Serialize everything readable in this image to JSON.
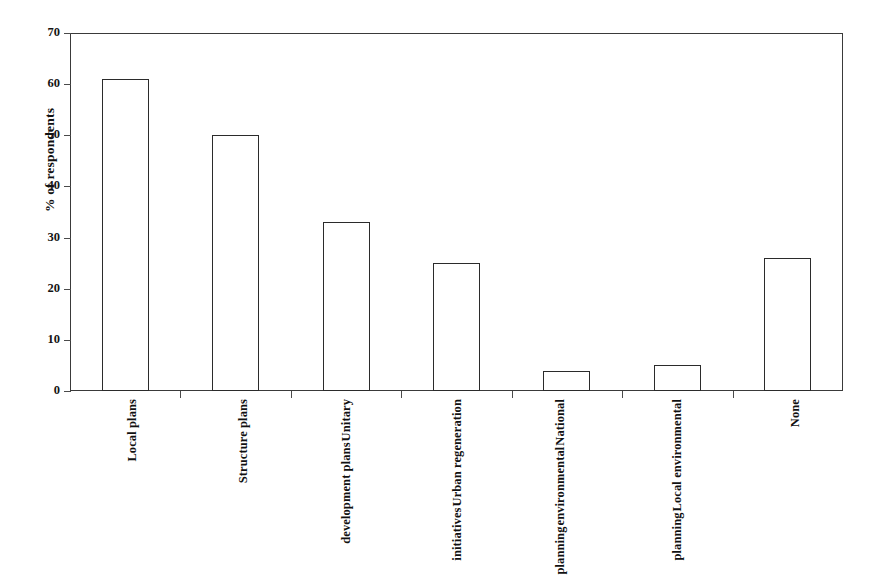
{
  "chart_data": {
    "type": "bar",
    "title": "",
    "xlabel": "",
    "ylabel": "% of respondents",
    "ylim": [
      0,
      70
    ],
    "ytick_step": 10,
    "yticks": [
      "70",
      "60",
      "50",
      "40",
      "30",
      "20",
      "10",
      "0"
    ],
    "grid": false,
    "legend": "none",
    "bar_fill_color": "#ffffff",
    "bar_edge_color": "#2b2b2b",
    "axis_color": "#3a3a3a",
    "categories": [
      "Local plans",
      "Structure plans",
      "Unitary development plans",
      "Urban regeneration initiatives",
      "National environmental planning",
      "Local environmental planning",
      "None"
    ],
    "category_label_lines": [
      [
        "Local plans"
      ],
      [
        "Structure plans"
      ],
      [
        "Unitary",
        "development plans"
      ],
      [
        "Urban regeneration",
        "initiatives"
      ],
      [
        "National",
        "environmental",
        "planning"
      ],
      [
        "Local environmental",
        "planning"
      ],
      [
        "None"
      ]
    ],
    "values": [
      61,
      50,
      33,
      25,
      4,
      5,
      26
    ]
  }
}
